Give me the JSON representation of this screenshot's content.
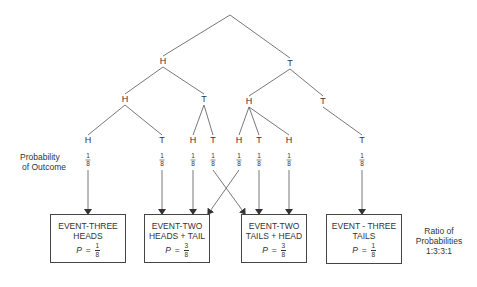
{
  "tree": {
    "root": {
      "x": 230,
      "y": 15
    },
    "level1": [
      {
        "label": "H",
        "x": 163,
        "y": 64
      },
      {
        "label": "T",
        "x": 290,
        "y": 66
      }
    ],
    "level2": [
      {
        "label": "H",
        "x": 125,
        "y": 102,
        "parent": 0
      },
      {
        "label": "T",
        "x": 204,
        "y": 102,
        "parent": 0
      },
      {
        "label": "H",
        "x": 249,
        "y": 104,
        "parent": 1
      },
      {
        "label": "T",
        "x": 323,
        "y": 104,
        "parent": 1
      }
    ],
    "leaves": [
      {
        "label": "H",
        "x": 88,
        "y": 143,
        "parent": 0,
        "prob": {
          "num": "1",
          "den": "8"
        },
        "target_box": 0
      },
      {
        "label": "T",
        "x": 162,
        "y": 143,
        "parent": 0,
        "prob": {
          "num": "1",
          "den": "8"
        },
        "target_box": 1
      },
      {
        "label": "H",
        "x": 193,
        "y": 143,
        "parent": 1,
        "prob": {
          "num": "1",
          "den": "8"
        },
        "target_box": 1
      },
      {
        "label": "T",
        "x": 213,
        "y": 143,
        "parent": 1,
        "prob": {
          "num": "1",
          "den": "8"
        },
        "target_box": 2
      },
      {
        "label": "H",
        "x": 239,
        "y": 143,
        "parent": 2,
        "prob": {
          "num": "1",
          "den": "8"
        },
        "target_box": 1
      },
      {
        "label": "T",
        "x": 259,
        "y": 143,
        "parent": 2,
        "prob": {
          "num": "1",
          "den": "8"
        },
        "target_box": 2
      },
      {
        "label": "H",
        "x": 289,
        "y": 143,
        "parent": 2,
        "prob": {
          "num": "1",
          "den": "8"
        },
        "target_box": 2
      },
      {
        "label": "T",
        "x": 362,
        "y": 143,
        "parent": 3,
        "prob": {
          "num": "1",
          "den": "8"
        },
        "target_box": 3
      }
    ]
  },
  "probability_label": {
    "line1": "Probability",
    "line2": "of Outcome"
  },
  "events": [
    {
      "line1": "EVENT-THREE",
      "line2": "HEADS",
      "p_var": "P",
      "p_eq": "=",
      "p_num": "1",
      "p_den": "8",
      "x": 50,
      "y": 214,
      "w": 76,
      "h": 49
    },
    {
      "line1": "EVENT-TWO",
      "line2": "HEADS + TAIL",
      "p_var": "P",
      "p_eq": "=",
      "p_num": "3",
      "p_den": "8",
      "x": 144,
      "y": 214,
      "w": 66,
      "h": 49
    },
    {
      "line1": "EVENT-TWO",
      "line2": "TAILS + HEAD",
      "p_var": "P",
      "p_eq": "=",
      "p_num": "3",
      "p_den": "8",
      "x": 241,
      "y": 214,
      "w": 66,
      "h": 49
    },
    {
      "line1": "EVENT - THREE",
      "line2": "TAILS",
      "p_var": "P",
      "p_eq": "=",
      "p_num": "1",
      "p_den": "8",
      "x": 326,
      "y": 214,
      "w": 76,
      "h": 50
    }
  ],
  "ratio_label": {
    "line1": "Ratio of",
    "line2": "Probabilities",
    "line3": "1:3:3:1"
  }
}
